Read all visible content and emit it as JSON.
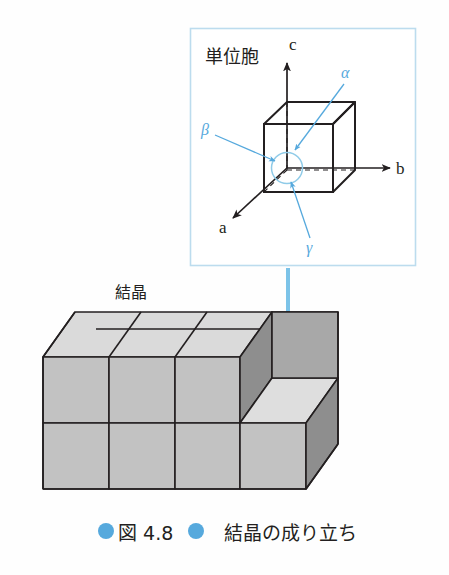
{
  "figure": {
    "caption_prefix_label": "図 4.8",
    "caption_title": "結晶の成り立ち",
    "caption_bullet": "filled-circle",
    "accent_color": "#56a9dd",
    "line_color": "#231f20",
    "cube_front_fill": "#c2c2c2",
    "cube_top_fill": "#dadada",
    "cube_side_fill": "#9a9a9a",
    "inset_border_color": "#bcdcee",
    "background": "#fefefe"
  },
  "inset": {
    "title": "単位胞",
    "axes": [
      {
        "name": "axis-c",
        "label": "c"
      },
      {
        "name": "axis-b",
        "label": "b"
      },
      {
        "name": "axis-a",
        "label": "a"
      }
    ],
    "angles": [
      {
        "name": "angle-alpha",
        "label": "α"
      },
      {
        "name": "angle-beta",
        "label": "β"
      },
      {
        "name": "angle-gamma",
        "label": "γ"
      }
    ]
  },
  "crystal": {
    "title": "結晶",
    "arrow": "down-arrow"
  }
}
